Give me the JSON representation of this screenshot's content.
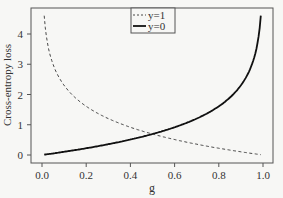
{
  "chart_data": {
    "type": "line",
    "title": "",
    "xlabel": "g",
    "ylabel": "Cross-entropy loss",
    "xlim": [
      0.0,
      1.0
    ],
    "ylim": [
      0,
      4.6
    ],
    "xticks": [
      "0.0",
      "0.2",
      "0.4",
      "0.6",
      "0.8",
      "1.0"
    ],
    "yticks": [
      "0",
      "1",
      "2",
      "3",
      "4"
    ],
    "grid": false,
    "legend_position": "top-center",
    "series": [
      {
        "name": "y=1",
        "style": "dashed",
        "formula": "-ln(g)",
        "x": [
          0.01,
          0.05,
          0.1,
          0.2,
          0.3,
          0.4,
          0.5,
          0.6,
          0.7,
          0.8,
          0.9,
          0.99
        ],
        "values": [
          4.61,
          3.0,
          2.3,
          1.61,
          1.2,
          0.92,
          0.69,
          0.51,
          0.36,
          0.22,
          0.11,
          0.01
        ]
      },
      {
        "name": "y=0",
        "style": "solid",
        "formula": "-ln(1-g)",
        "x": [
          0.01,
          0.1,
          0.2,
          0.3,
          0.4,
          0.5,
          0.6,
          0.7,
          0.8,
          0.9,
          0.95,
          0.99
        ],
        "values": [
          0.01,
          0.11,
          0.22,
          0.36,
          0.51,
          0.69,
          0.92,
          1.2,
          1.61,
          2.3,
          3.0,
          4.61
        ]
      }
    ]
  }
}
